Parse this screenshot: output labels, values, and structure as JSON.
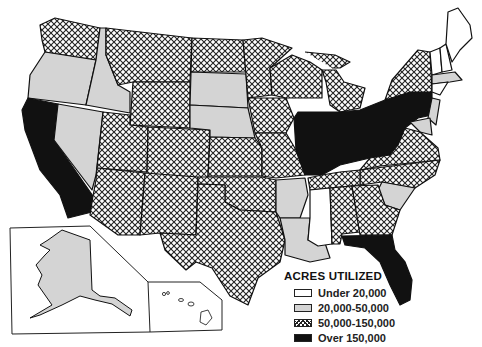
{
  "legend": {
    "title": "ACRES UTILIZED",
    "items": [
      {
        "label": "Under 20,000",
        "fill": "white"
      },
      {
        "label": "20,000-50,000",
        "fill": "gray"
      },
      {
        "label": "50,000-150,000",
        "fill": "crosshatch"
      },
      {
        "label": "Over 150,000",
        "fill": "black"
      }
    ]
  },
  "colors": {
    "white": "#ffffff",
    "gray": "#d4d4d4",
    "crosshatch": "#222222",
    "black": "#111111",
    "border": "#111111"
  },
  "states": {
    "under_20000": [
      "Maine",
      "New Hampshire",
      "Vermont",
      "Mississippi",
      "Rhode Island",
      "Delaware",
      "Hawaii"
    ],
    "20000_50000": [
      "Oregon",
      "Idaho",
      "Nevada",
      "South Dakota",
      "Nebraska",
      "Arkansas",
      "Louisiana",
      "South Carolina",
      "Massachusetts",
      "Connecticut",
      "New Jersey",
      "Maryland",
      "Alaska"
    ],
    "50000_150000": [
      "Washington",
      "Montana",
      "Wyoming",
      "Utah",
      "Colorado",
      "Arizona",
      "New Mexico",
      "Texas",
      "Oklahoma",
      "Kansas",
      "North Dakota",
      "Minnesota",
      "Iowa",
      "Missouri",
      "Wisconsin",
      "Michigan",
      "New York",
      "Virginia",
      "North Carolina",
      "Tennessee",
      "Alabama",
      "Georgia"
    ],
    "over_150000": [
      "California",
      "Illinois",
      "Indiana",
      "Ohio",
      "Kentucky",
      "West Virginia",
      "Pennsylvania",
      "Florida"
    ]
  }
}
